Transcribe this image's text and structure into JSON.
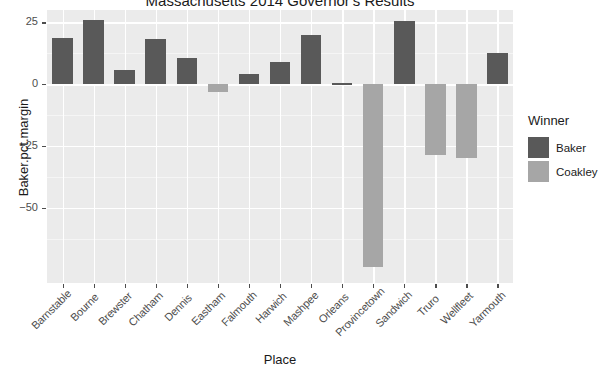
{
  "chart_data": {
    "type": "bar",
    "title": "Massachusetts 2014 Governor's Results",
    "xlabel": "Place",
    "ylabel": "Baker.pct.margin",
    "categories": [
      "Barnstable",
      "Bourne",
      "Brewster",
      "Chatham",
      "Dennis",
      "Eastham",
      "Falmouth",
      "Harwich",
      "Mashpee",
      "Orleans",
      "Provincetown",
      "Sandwich",
      "Truro",
      "Wellfleet",
      "Yarmouth"
    ],
    "values": [
      18.6,
      25.8,
      5.6,
      18.3,
      10.5,
      -3.0,
      4.0,
      8.8,
      20.0,
      0.4,
      -74.2,
      25.4,
      -28.6,
      -29.8,
      12.7
    ],
    "group": [
      "Baker",
      "Baker",
      "Baker",
      "Baker",
      "Baker",
      "Coakley",
      "Baker",
      "Baker",
      "Baker",
      "Baker",
      "Coakley",
      "Baker",
      "Coakley",
      "Coakley",
      "Baker"
    ],
    "ylim": [
      -80.5,
      30.0
    ],
    "yticks": [
      25,
      0,
      -25,
      -50
    ],
    "ytick_labels": [
      "25",
      "0",
      "-25",
      "-50"
    ],
    "grid": true,
    "legend_position": "right",
    "legend": {
      "title": "Winner",
      "entries": [
        {
          "label": "Baker",
          "color": "#595959"
        },
        {
          "label": "Coakley",
          "color": "#a6a6a6"
        }
      ]
    },
    "colors": {
      "baker": "#595959",
      "coakley": "#a6a6a6",
      "panel_background": "#ebebeb",
      "gridline": "#ffffff",
      "text": "#1a1a1a",
      "axis_text": "#4d4d4d"
    }
  }
}
